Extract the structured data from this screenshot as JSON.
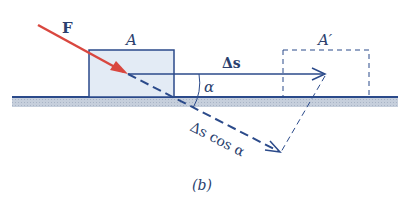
{
  "figure": {
    "caption": "(b)",
    "labels": {
      "force": "F",
      "block_initial": "A",
      "block_final": "A′",
      "displacement": "Δs",
      "angle": "α",
      "projection": "Δs cos α"
    },
    "colors": {
      "force_arrow": "#d9473f",
      "lines": "#2b4a8a",
      "block_fill": "#e3ebf5",
      "ground_fill": "#b9c3d3",
      "text": "#2b3f6e"
    }
  }
}
